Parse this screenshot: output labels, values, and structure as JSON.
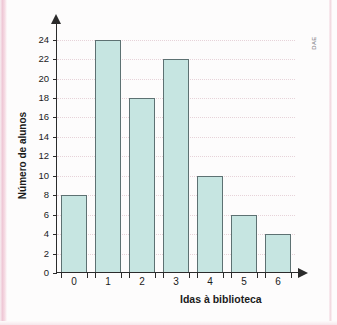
{
  "credit": {
    "label": "DAE"
  },
  "colors": {
    "bar_fill": "#c6e5e1",
    "bar_stroke": "#5d7172",
    "axis": "#2b2b2b",
    "gridline": "#e7d3d9",
    "page_background": "#fdfcfc",
    "edge_stripe": "#efc8d6"
  },
  "chart_data": {
    "type": "bar",
    "title": "",
    "subtitle": "",
    "xlabel": "Idas à biblioteca",
    "ylabel": "Número de alunos",
    "categories": [
      "0",
      "1",
      "2",
      "3",
      "4",
      "5",
      "6"
    ],
    "values": [
      8,
      24,
      18,
      22,
      10,
      6,
      4
    ],
    "series": [
      {
        "name": "Número de alunos",
        "values": [
          8,
          24,
          18,
          22,
          10,
          6,
          4
        ]
      }
    ],
    "ylim": [
      0,
      25
    ],
    "ytick_labels": [
      "0",
      "2",
      "4",
      "6",
      "8",
      "10",
      "12",
      "14",
      "16",
      "18",
      "20",
      "22",
      "24"
    ],
    "ytick_values": [
      0,
      2,
      4,
      6,
      8,
      10,
      12,
      14,
      16,
      18,
      20,
      22,
      24
    ],
    "xtick_labels": [
      "0",
      "1",
      "2",
      "3",
      "4",
      "5",
      "6"
    ],
    "grid": true,
    "grid_axis": "y",
    "legend": false,
    "legend_position": "none",
    "annotations": [
      "DAE"
    ]
  }
}
